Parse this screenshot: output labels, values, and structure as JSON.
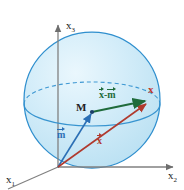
{
  "figure": {
    "background_color": "#ffffff",
    "width": 184,
    "height": 190
  },
  "axes": {
    "x1": {
      "label": "x",
      "subscript": "1",
      "name": "x1-axis"
    },
    "x2": {
      "label": "x",
      "subscript": "2",
      "name": "x2-axis"
    },
    "x3": {
      "label": "x",
      "subscript": "3",
      "name": "x3-axis"
    },
    "axis_color": "#808080",
    "origin_label": ""
  },
  "sphere": {
    "name": "sphere",
    "fill_color": "#cfeaf7",
    "stroke_color": "#2f8fce",
    "equator_color": "#2f8fce",
    "highlight_color": "#eaf7fd"
  },
  "points": {
    "center": {
      "label": "M",
      "color": "#222222"
    },
    "surface": {
      "label": "x",
      "color": "#c0392b"
    }
  },
  "vectors": {
    "m": {
      "label": "m",
      "color": "#2b6fb5",
      "description": "position vector of sphere center"
    },
    "x": {
      "label": "x",
      "color": "#b03a2e",
      "description": "position vector of point on sphere"
    },
    "x_minus_m": {
      "label_left": "x",
      "label_op": "-",
      "label_right": "m",
      "color": "#1f6b3b",
      "description": "difference vector from M to x"
    }
  }
}
